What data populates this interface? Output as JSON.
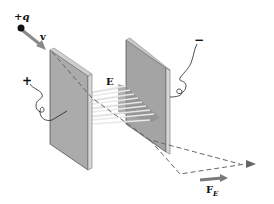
{
  "diagram": {
    "charge": {
      "sign": "+",
      "symbol": "q"
    },
    "velocity_label": "v",
    "field_label": "E",
    "force_label": "F",
    "force_subscript": "E",
    "left_plate_sign": "+",
    "right_plate_sign": "−",
    "colors": {
      "plate_face": "#a9a9a9",
      "plate_edge": "#d8d8d8",
      "plate_outline": "#555555",
      "field_lines": "#e6e6e6",
      "field_shadow": "#8f8f8f",
      "velocity_arrow": "#8a8a8a",
      "force_arrow": "#7a7a7a",
      "trajectory": "#666666",
      "charge": "#111111",
      "text": "#111111"
    }
  }
}
